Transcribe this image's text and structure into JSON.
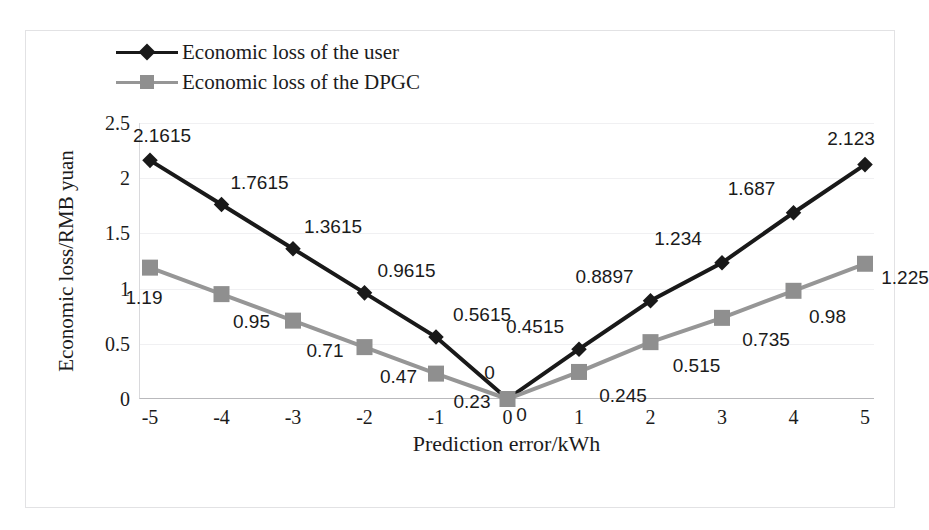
{
  "chart_data": {
    "type": "line",
    "title": "",
    "xlabel": "Prediction error/kWh",
    "ylabel": "Economic loss/RMB yuan",
    "x": [
      -5,
      -4,
      -3,
      -2,
      -1,
      0,
      1,
      2,
      3,
      4,
      5
    ],
    "xticklabels": [
      "-5",
      "-4",
      "-3",
      "-2",
      "-1",
      "0",
      "1",
      "2",
      "3",
      "4",
      "5"
    ],
    "yticks": [
      0,
      0.5,
      1,
      1.5,
      2,
      2.5
    ],
    "yticklabels": [
      "0",
      "0.5",
      "1",
      "1.5",
      "2",
      "2.5"
    ],
    "ylim": [
      0,
      2.5
    ],
    "xlim": [
      -5,
      5
    ],
    "grid": true,
    "legend_position": "top-left-outside",
    "series": [
      {
        "name": "Economic loss of the user",
        "color": "#191919",
        "marker": "diamond",
        "values": [
          2.1615,
          1.7615,
          1.3615,
          0.9615,
          0.5615,
          0,
          0.4515,
          0.8897,
          1.234,
          1.687,
          2.123
        ],
        "labels": [
          "2.1615",
          "1.7615",
          "1.3615",
          "0.9615",
          "0.5615",
          "0",
          "0.4515",
          "0.8897",
          "1.234",
          "1.687",
          "2.123"
        ]
      },
      {
        "name": "Economic loss of the DPGC",
        "color": "#969696",
        "marker": "square",
        "values": [
          1.19,
          0.95,
          0.71,
          0.47,
          0.23,
          0,
          0.245,
          0.515,
          0.735,
          0.98,
          1.225
        ],
        "labels": [
          "1.19",
          "0.95",
          "0.71",
          "0.47",
          "0.23",
          "0",
          "0.245",
          "0.515",
          "0.735",
          "0.98",
          "1.225"
        ]
      }
    ]
  },
  "legend": {
    "items": [
      {
        "label": "Economic loss of the user",
        "marker": "diamond-marker-icon",
        "color": "#191919"
      },
      {
        "label": "Economic loss of the DPGC",
        "marker": "square-marker-icon",
        "color": "#969696"
      }
    ]
  }
}
